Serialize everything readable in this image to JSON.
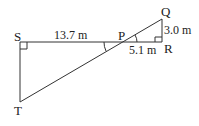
{
  "diagram": {
    "points": {
      "S": {
        "label": "S"
      },
      "T": {
        "label": "T"
      },
      "P": {
        "label": "P"
      },
      "Q": {
        "label": "Q"
      },
      "R": {
        "label": "R"
      }
    },
    "measurements": {
      "SP": "13.7 m",
      "PR": "5.1 m",
      "QR": "3.0 m"
    },
    "line_color": "#333333"
  }
}
